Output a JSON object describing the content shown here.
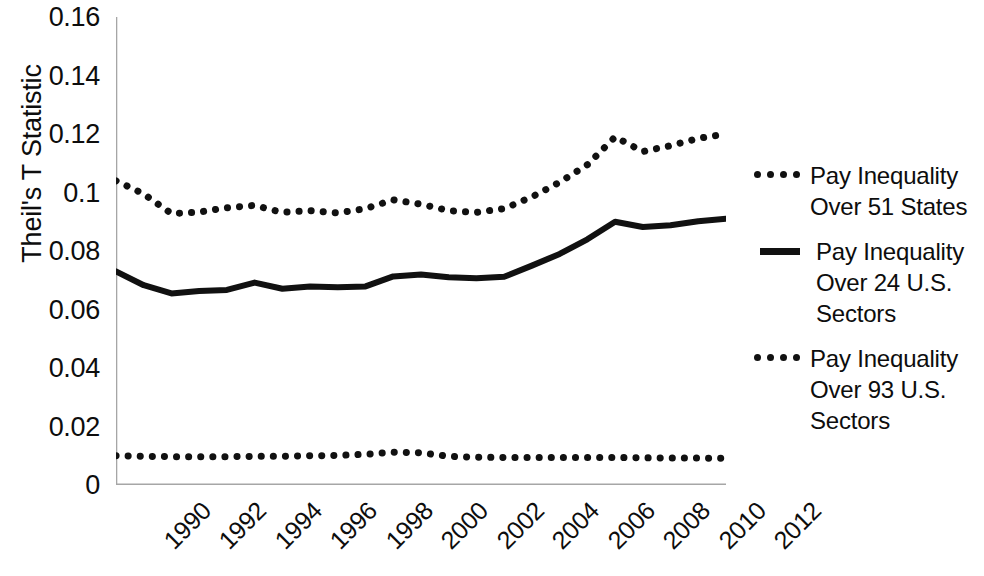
{
  "chart_data": {
    "type": "line",
    "title": "",
    "xlabel": "",
    "ylabel": "Theil's T Statistic",
    "ylim": [
      0,
      0.16
    ],
    "yticks": [
      "0",
      "0.02",
      "0.04",
      "0.06",
      "0.08",
      "0.1",
      "0.12",
      "0.14",
      "0.16"
    ],
    "ytick_values": [
      0,
      0.02,
      0.04,
      0.06,
      0.08,
      0.1,
      0.12,
      0.14,
      0.16
    ],
    "grid": false,
    "legend_position": "right",
    "x": [
      1990,
      1991,
      1992,
      1993,
      1994,
      1995,
      1996,
      1997,
      1998,
      1999,
      2000,
      2001,
      2002,
      2003,
      2004,
      2005,
      2006,
      2007,
      2008,
      2009,
      2010,
      2011,
      2012
    ],
    "xtick_labels": [
      "1990",
      "1992",
      "1994",
      "1996",
      "1998",
      "2000",
      "2002",
      "2004",
      "2006",
      "2008",
      "2010",
      "2012"
    ],
    "xtick_values": [
      1990,
      1992,
      1994,
      1996,
      1998,
      2000,
      2002,
      2004,
      2006,
      2008,
      2010,
      2012
    ],
    "series": [
      {
        "name": "Pay Inequality Over 51 States",
        "style": "dotted",
        "color": "#111111",
        "values": [
          0.01,
          0.0098,
          0.0097,
          0.0097,
          0.0097,
          0.0098,
          0.0098,
          0.01,
          0.0101,
          0.0105,
          0.0112,
          0.011,
          0.0098,
          0.0095,
          0.0094,
          0.0094,
          0.0094,
          0.0094,
          0.0094,
          0.0093,
          0.0092,
          0.0092,
          0.0091
        ]
      },
      {
        "name": "Pay Inequality Over 24 U.S. Sectors",
        "style": "solid",
        "color": "#111111",
        "values": [
          0.073,
          0.0683,
          0.0655,
          0.0663,
          0.0667,
          0.0692,
          0.0671,
          0.0679,
          0.0676,
          0.0679,
          0.0713,
          0.072,
          0.071,
          0.0707,
          0.0712,
          0.075,
          0.079,
          0.084,
          0.09,
          0.0882,
          0.0888,
          0.0902,
          0.091
        ]
      },
      {
        "name": "Pay Inequality Over 93 U.S. Sectors",
        "style": "dotted",
        "color": "#111111",
        "values": [
          0.104,
          0.0995,
          0.0928,
          0.0933,
          0.0948,
          0.0956,
          0.0932,
          0.0938,
          0.093,
          0.0945,
          0.0975,
          0.096,
          0.0938,
          0.0932,
          0.0945,
          0.0985,
          0.1035,
          0.1095,
          0.119,
          0.114,
          0.116,
          0.1185,
          0.12
        ]
      }
    ]
  },
  "legend": {
    "entries": [
      {
        "label": "Pay Inequality Over 51 States",
        "marker": "dotted-line-marker"
      },
      {
        "label": "Pay Inequality Over 24 U.S. Sectors",
        "marker": "solid-line-marker"
      },
      {
        "label": "Pay Inequality Over 93 U.S. Sectors",
        "marker": "dotted-line-marker"
      }
    ]
  }
}
